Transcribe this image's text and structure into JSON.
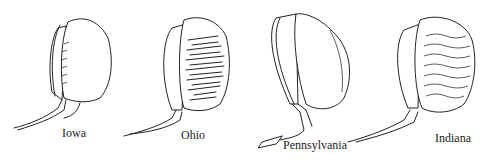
{
  "figure": {
    "items": [
      {
        "label": "Iowa",
        "style": "plain crown with pleated edge"
      },
      {
        "label": "Ohio",
        "style": "heavily textured crown"
      },
      {
        "label": "Pennsylvania",
        "style": "plain smooth crown"
      },
      {
        "label": "Indiana",
        "style": "wavy shirred crown"
      }
    ]
  },
  "colors": {
    "background": "#ffffff",
    "ink": "#222222"
  }
}
